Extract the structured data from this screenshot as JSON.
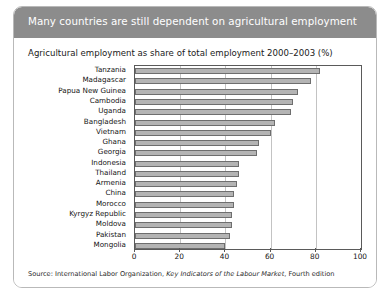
{
  "figure": {
    "title": "Many countries are still dependent on agricultural employment",
    "subtitle": "Agricultural employment as share of total employment 2000–2003 (%)",
    "source_prefix": "Source: International Labor Organization, ",
    "source_italic": "Key Indicators of the Labour Market",
    "source_suffix": ", Fourth edition"
  },
  "colors": {
    "banner": "#8c8c8c",
    "banner_text": "#ffffff",
    "bar_fill": "#b4b4b4",
    "bar_stroke": "#6e6e6e",
    "gridline": "#c3c3c3",
    "axis": "#5a5a5a",
    "card_border": "#b9b9b9"
  },
  "chart_data": {
    "type": "bar",
    "orientation": "horizontal",
    "title": "Many countries are still dependent on agricultural employment",
    "subtitle": "Agricultural employment as share of total employment 2000–2003 (%)",
    "xlabel": "",
    "ylabel": "",
    "xlim": [
      0,
      100
    ],
    "xticks": [
      0,
      20,
      40,
      60,
      80,
      100
    ],
    "xtick_labels": [
      "0",
      "20",
      "40",
      "60",
      "80",
      "100"
    ],
    "grid": true,
    "legend": false,
    "categories": [
      "Tanzania",
      "Madagascar",
      "Papua New Guinea",
      "Cambodia",
      "Uganda",
      "Bangladesh",
      "Vietnam",
      "Ghana",
      "Georgia",
      "Indonesia",
      "Thailand",
      "Armenia",
      "China",
      "Morocco",
      "Kyrgyz Republic",
      "Moldova",
      "Pakistan",
      "Mongolia"
    ],
    "values": [
      82,
      78,
      72,
      70,
      69,
      62,
      60,
      55,
      54,
      46,
      46,
      45,
      44,
      44,
      43,
      43,
      42,
      40
    ],
    "units": "%"
  }
}
